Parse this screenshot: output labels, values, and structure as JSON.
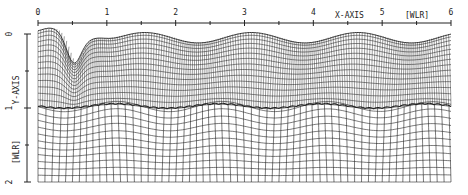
{
  "figure": {
    "x_axis": {
      "label": "X-AXIS",
      "unit": "[WLR]",
      "ticks": [
        "0",
        "1",
        "2",
        "3",
        "4",
        "5",
        "6"
      ],
      "range": [
        0,
        6
      ]
    },
    "y_axis": {
      "label": "Y-AXIS",
      "unit": "[WLR]",
      "ticks": [
        "0",
        "1",
        "2"
      ],
      "range": [
        0,
        2
      ]
    },
    "colors": {
      "line": "#222222",
      "background": "#ffffff"
    },
    "upper_region": {
      "description": "fine curvilinear mesh following wavy free surface",
      "columns": 180,
      "rows": 14
    },
    "lower_region": {
      "description": "coarser mesh below interface",
      "columns": 60,
      "rows": 11
    },
    "interface_marker": "scalloped interface line near y = 1"
  }
}
